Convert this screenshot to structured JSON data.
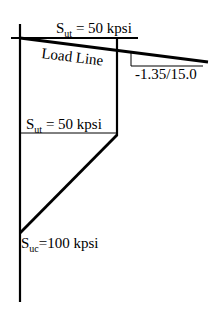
{
  "diagram": {
    "type": "modified-mohr-failure-envelope",
    "labels": {
      "sut_top": {
        "main": "S",
        "sub": "ut",
        "rest": " = 50 kpsi"
      },
      "load_line": "Load Line",
      "slope": "-1.35/15.0",
      "sut_mid": {
        "main": "S",
        "sub": "ut",
        "rest": " = 50 kpsi"
      },
      "suc": {
        "main": "S",
        "sub": "uc",
        "rest": "=100 kpsi"
      }
    },
    "colors": {
      "stroke": "#000000",
      "background": "#ffffff"
    }
  }
}
